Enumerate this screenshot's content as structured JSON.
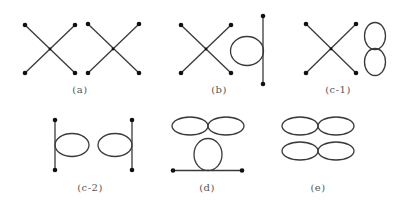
{
  "figure": {
    "panels": [
      {
        "id": "a",
        "label": "(a)",
        "description": "two crossing lines, pair"
      },
      {
        "id": "b",
        "label": "(b)",
        "description": "crossing lines plus loop on vertical line"
      },
      {
        "id": "c-1",
        "label": "(c-1)",
        "description": "crossing lines plus figure-eight"
      },
      {
        "id": "c-2",
        "label": "(c-2)",
        "description": "two loops each on a vertical line"
      },
      {
        "id": "d",
        "label": "(d)",
        "description": "figure-eight above loop on horizontal line"
      },
      {
        "id": "e",
        "label": "(e)",
        "description": "two figure-eights"
      }
    ],
    "colors": {
      "stroke": "#3a3a3a",
      "dot": "#111111",
      "label": "#555555"
    }
  }
}
